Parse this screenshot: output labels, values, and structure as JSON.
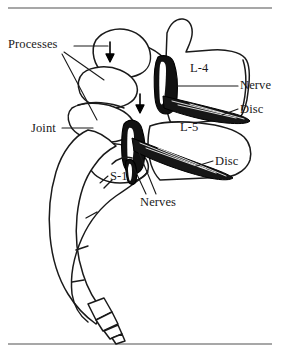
{
  "figure": {
    "view": "lateral (side) view",
    "background_color": "#ffffff",
    "ink_color": "#1a1a1a",
    "frame_rule_color": "#8a8a8a"
  },
  "labels": {
    "processes": "Processes",
    "joint": "Joint",
    "l4": "L-4",
    "nerve": "Nerve",
    "disc_upper": "Disc",
    "l5": "L-5",
    "disc_lower": "Disc",
    "s1": "S-1",
    "nerves": "Nerves"
  },
  "structures": {
    "vertebrae": [
      "L-4",
      "L-5",
      "S-1"
    ],
    "soft_tissue": [
      "Nerve",
      "Nerves",
      "Disc",
      "Disc"
    ],
    "joints": [
      "Joint"
    ],
    "processes": [
      "Processes"
    ],
    "sacrum_coccyx_segments": 4
  },
  "annotations": {
    "arrow_count": 2,
    "arrow_direction": "down",
    "leader_line_count": 9
  }
}
